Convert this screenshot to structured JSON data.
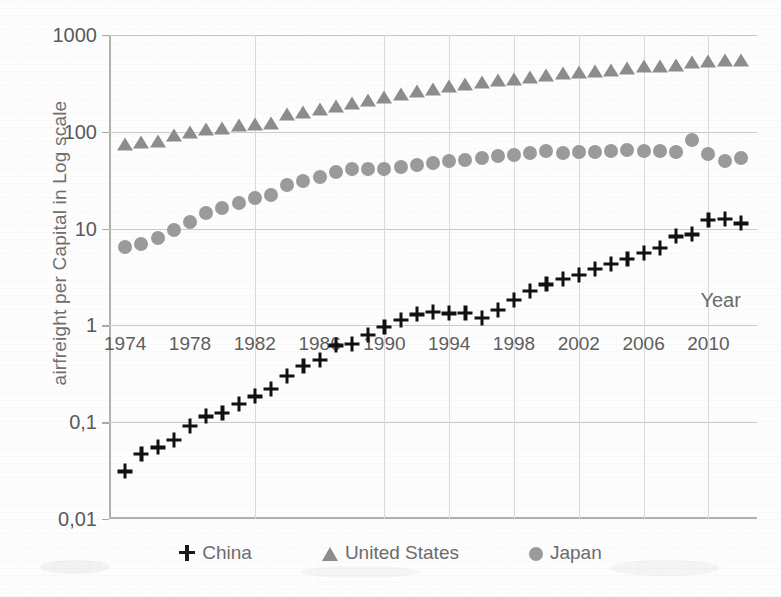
{
  "chart_data": {
    "type": "scatter",
    "title": "",
    "xlabel": "Year",
    "ylabel": "airfreight  per Capital in Log scale",
    "yscale": "log",
    "ylim": [
      0.01,
      1000
    ],
    "ytick_labels": [
      "0,01",
      "0,1",
      "1",
      "10",
      "100",
      "1000"
    ],
    "ytick_values": [
      0.01,
      0.1,
      1,
      10,
      100,
      1000
    ],
    "xlim": [
      1973,
      2013
    ],
    "xtick_labels": [
      "1974",
      "1978",
      "1982",
      "1986",
      "1990",
      "1994",
      "1998",
      "2002",
      "2006",
      "2010"
    ],
    "xtick_values": [
      1974,
      1978,
      1982,
      1986,
      1990,
      1994,
      1998,
      2002,
      2006,
      2010
    ],
    "grid": "both",
    "legend_position": "bottom",
    "x": [
      1974,
      1975,
      1976,
      1977,
      1978,
      1979,
      1980,
      1981,
      1982,
      1983,
      1984,
      1985,
      1986,
      1987,
      1988,
      1989,
      1990,
      1991,
      1992,
      1993,
      1994,
      1995,
      1996,
      1997,
      1998,
      1999,
      2000,
      2001,
      2002,
      2003,
      2004,
      2005,
      2006,
      2007,
      2008,
      2009,
      2010,
      2011,
      2012
    ],
    "series": [
      {
        "name": "China",
        "marker": "plus",
        "color": "#111111",
        "values": [
          0.031,
          0.047,
          0.055,
          0.066,
          0.092,
          0.115,
          0.125,
          0.155,
          0.185,
          0.22,
          0.3,
          0.38,
          0.44,
          0.62,
          0.65,
          0.8,
          0.96,
          1.15,
          1.3,
          1.38,
          1.33,
          1.35,
          1.2,
          1.45,
          1.85,
          2.25,
          2.65,
          3.05,
          3.3,
          3.8,
          4.35,
          4.9,
          5.6,
          6.3,
          8.3,
          8.7,
          12.2,
          12.5,
          11.3
        ]
      },
      {
        "name": "United States",
        "marker": "triangle",
        "color": "#8c8c8c",
        "values": [
          75,
          78,
          81,
          93,
          100,
          108,
          110,
          118,
          120,
          122,
          152,
          160,
          172,
          185,
          200,
          215,
          230,
          248,
          262,
          278,
          295,
          310,
          330,
          345,
          355,
          370,
          390,
          405,
          410,
          425,
          440,
          460,
          475,
          480,
          495,
          520,
          545,
          555,
          550
        ]
      },
      {
        "name": "Japan",
        "marker": "circle",
        "color": "#9a9a9a",
        "values": [
          6.5,
          7.0,
          8.0,
          9.6,
          11.8,
          14.5,
          16.5,
          18.5,
          20.5,
          22.5,
          28.0,
          31.0,
          34.0,
          38.0,
          41.0,
          41.5,
          41.0,
          43.5,
          45.0,
          47.5,
          50.0,
          51.5,
          53.0,
          56.0,
          58.0,
          61.0,
          63.5,
          61.0,
          61.5,
          62.5,
          63.5,
          64.5,
          63.0,
          63.5,
          62.0,
          82.0,
          59.0,
          50.0,
          53.0
        ]
      }
    ]
  },
  "legend": {
    "items": [
      {
        "label": "China",
        "marker": "plus"
      },
      {
        "label": "United States",
        "marker": "triangle"
      },
      {
        "label": "Japan",
        "marker": "circle"
      }
    ]
  }
}
